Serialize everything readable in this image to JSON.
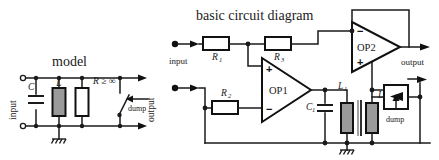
{
  "figure": {
    "background_color": "#ffffff",
    "ink_color": "#1a1a1a",
    "component_fill_gray": "#9a9a9a"
  },
  "left_circuit": {
    "title": "model",
    "port_input_label": "input",
    "port_output_label": "output",
    "components": [
      {
        "id": "C",
        "label": "C",
        "type": "capacitor"
      },
      {
        "id": "L",
        "label": "L",
        "type": "inductor"
      },
      {
        "id": "R",
        "label": "R ≥ ∞",
        "type": "resistor"
      },
      {
        "id": "SW",
        "label": "dump",
        "type": "switch"
      }
    ],
    "ground_label": ""
  },
  "right_circuit": {
    "title": "basic circuit diagram",
    "port_input_label": "input",
    "port_output_label": "output",
    "components": [
      {
        "id": "R1",
        "label": "R",
        "sub": "1",
        "type": "resistor"
      },
      {
        "id": "R2",
        "label": "R",
        "sub": "2",
        "type": "resistor"
      },
      {
        "id": "R3",
        "label": "R",
        "sub": "3",
        "type": "resistor"
      },
      {
        "id": "C1",
        "label": "C",
        "sub": "1",
        "type": "capacitor"
      },
      {
        "id": "L1",
        "label": "L",
        "sub": "1",
        "type": "inductor"
      },
      {
        "id": "L2",
        "label": "L",
        "sub": "2",
        "type": "inductor"
      },
      {
        "id": "OP1",
        "label": "OP1",
        "type": "opamp",
        "plus_position": "top",
        "minus_position": "bottom"
      },
      {
        "id": "OP2",
        "label": "OP2",
        "type": "opamp",
        "plus_position": "bottom",
        "minus_position": "top"
      },
      {
        "id": "DUMP",
        "label": "dump",
        "type": "photo-triac"
      }
    ]
  }
}
